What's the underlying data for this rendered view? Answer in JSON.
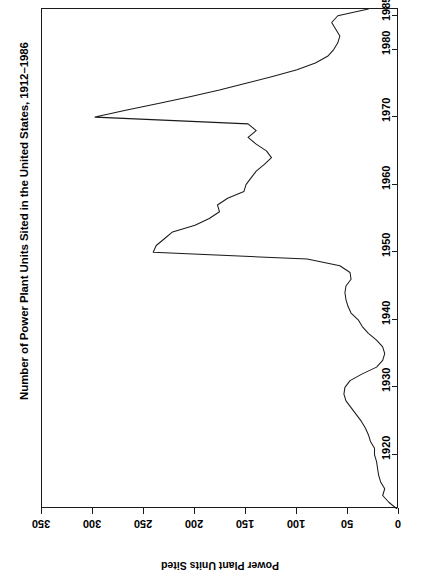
{
  "chart_data": {
    "type": "line",
    "title": "Number of Power Plant Units Sited in the United States, 1912–1986",
    "orientation": "rotated-90",
    "xlabel": "",
    "ylabel": "Power Plant Units Sited",
    "value_axis_label": "Power Plant Units Sited",
    "value_ticks": [
      350,
      300,
      250,
      200,
      150,
      100,
      50,
      0
    ],
    "value_axis_reversed": true,
    "ylim": [
      0,
      350
    ],
    "year_ticks": [
      1920,
      1930,
      1940,
      1950,
      1960,
      1970,
      1980,
      1985
    ],
    "xlim": [
      1912,
      1986
    ],
    "grid": false,
    "legend": null,
    "x": [
      1912,
      1913,
      1914,
      1915,
      1916,
      1917,
      1918,
      1919,
      1920,
      1921,
      1922,
      1923,
      1924,
      1925,
      1926,
      1927,
      1928,
      1929,
      1930,
      1931,
      1932,
      1933,
      1934,
      1935,
      1936,
      1937,
      1938,
      1939,
      1940,
      1941,
      1942,
      1943,
      1944,
      1945,
      1946,
      1947,
      1948,
      1949,
      1950,
      1951,
      1952,
      1953,
      1954,
      1955,
      1956,
      1957,
      1958,
      1959,
      1960,
      1961,
      1962,
      1963,
      1964,
      1965,
      1966,
      1967,
      1968,
      1969,
      1970,
      1971,
      1972,
      1973,
      1974,
      1975,
      1976,
      1977,
      1978,
      1979,
      1980,
      1981,
      1982,
      1983,
      1984,
      1985,
      1986
    ],
    "values": [
      2,
      10,
      16,
      14,
      18,
      20,
      21,
      22,
      24,
      24,
      28,
      30,
      33,
      37,
      42,
      47,
      52,
      54,
      53,
      48,
      36,
      22,
      16,
      14,
      16,
      22,
      30,
      36,
      40,
      47,
      50,
      52,
      53,
      52,
      47,
      48,
      58,
      90,
      241,
      238,
      230,
      222,
      200,
      186,
      176,
      178,
      168,
      152,
      150,
      145,
      140,
      132,
      125,
      130,
      140,
      148,
      140,
      148,
      298,
      268,
      236,
      205,
      176,
      150,
      124,
      100,
      82,
      70,
      64,
      60,
      58,
      62,
      66,
      60,
      30
    ]
  }
}
